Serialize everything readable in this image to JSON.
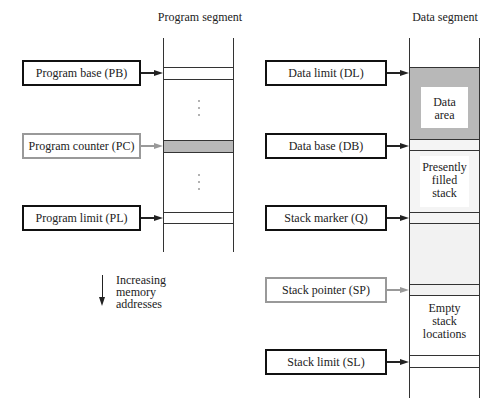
{
  "program_segment": {
    "title": "Program segment",
    "registers": [
      {
        "label": "Program base (PB)",
        "style": "dark"
      },
      {
        "label": "Program counter (PC)",
        "style": "grey"
      },
      {
        "label": "Program limit (PL)",
        "style": "dark"
      }
    ]
  },
  "data_segment": {
    "title": "Data segment",
    "registers": [
      {
        "label": "Data limit (DL)",
        "style": "dark"
      },
      {
        "label": "Data base (DB)",
        "style": "dark"
      },
      {
        "label": "Stack marker (Q)",
        "style": "dark"
      },
      {
        "label": "Stack pointer (SP)",
        "style": "grey"
      },
      {
        "label": "Stack limit (SL)",
        "style": "dark"
      }
    ],
    "regions": {
      "data_area": "Data\narea",
      "presently_filled_stack": "Presently\nfilled\nstack",
      "empty_stack_locations": "Empty\nstack\nlocations"
    }
  },
  "legend": {
    "direction_note": "Increasing\nmemory\naddresses"
  },
  "colors": {
    "dark_border": "#111111",
    "grey_border": "#999999",
    "shaded_region": "#b8b8b8",
    "light_region": "#f2f2f2"
  }
}
